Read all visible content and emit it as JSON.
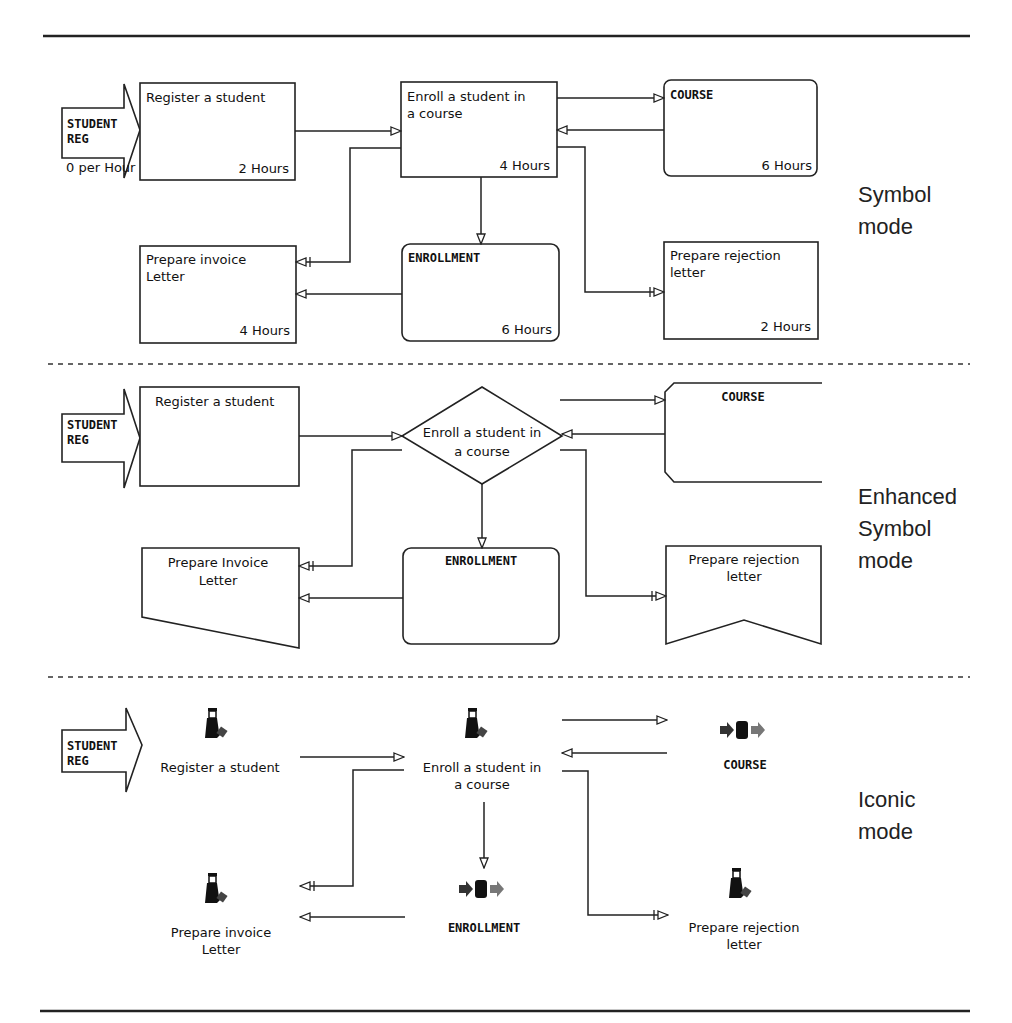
{
  "modes": {
    "symbol": {
      "line1": "Symbol",
      "line2": "mode"
    },
    "enhanced": {
      "line1": "Enhanced",
      "line2": "Symbol",
      "line3": "mode"
    },
    "iconic": {
      "line1": "Iconic",
      "line2": "mode"
    }
  },
  "arrival": {
    "line1": "STUDENT",
    "line2": "REG",
    "rate": "0 per Hour"
  },
  "symbol_section": {
    "register": {
      "title": "Register a student",
      "time": "2 Hours"
    },
    "enroll": {
      "line1": "Enroll a student in",
      "line2": "a course",
      "time": "4 Hours"
    },
    "course": {
      "title": "COURSE",
      "time": "6 Hours"
    },
    "invoice": {
      "line1": "Prepare invoice",
      "line2": "Letter",
      "time": "4 Hours"
    },
    "enrollment": {
      "title": "ENROLLMENT",
      "time": "6 Hours"
    },
    "rejection": {
      "line1": "Prepare rejection",
      "line2": "letter",
      "time": "2 Hours"
    }
  },
  "enhanced_section": {
    "register": {
      "title": "Register a student"
    },
    "enroll": {
      "line1": "Enroll a student in",
      "line2": "a course"
    },
    "course": {
      "title": "COURSE"
    },
    "invoice": {
      "line1": "Prepare Invoice",
      "line2": "Letter"
    },
    "enrollment": {
      "title": "ENROLLMENT"
    },
    "rejection": {
      "line1": "Prepare rejection",
      "line2": "letter"
    }
  },
  "iconic_section": {
    "register": {
      "title": "Register a student",
      "icon": "worker-icon"
    },
    "enroll": {
      "line1": "Enroll a student in",
      "line2": "a course",
      "icon": "worker-icon"
    },
    "course": {
      "title": "COURSE",
      "icon": "storage-icon"
    },
    "invoice": {
      "line1": "Prepare invoice",
      "line2": "Letter",
      "icon": "worker-icon"
    },
    "enrollment": {
      "title": "ENROLLMENT",
      "icon": "storage-icon"
    },
    "rejection": {
      "line1": "Prepare rejection",
      "line2": "letter",
      "icon": "worker-icon"
    }
  }
}
